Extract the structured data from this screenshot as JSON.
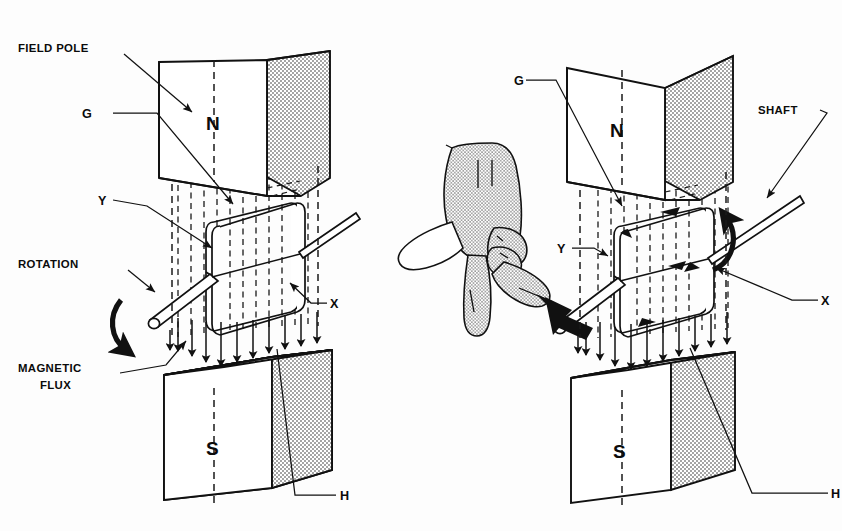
{
  "figure": {
    "kind": "technical-line-drawing",
    "background_color": "#fdfdfd",
    "ink_color": "#111111",
    "stipple_color": "#9a9a9a"
  },
  "panels": [
    {
      "id": "left",
      "name": "left-diagram",
      "labels": {
        "field_pole": "FIELD POLE",
        "g": "G",
        "y": "Y",
        "x": "X",
        "h": "H",
        "north_pole": "N",
        "south_pole": "S",
        "rotation": "ROTATION",
        "magnetic_flux": "MAGNETIC\nFLUX",
        "magnetic_flux_line1": "MAGNETIC",
        "magnetic_flux_line2": "FLUX"
      }
    },
    {
      "id": "right",
      "name": "right-diagram",
      "labels": {
        "g": "G",
        "y": "Y",
        "x": "X",
        "h": "H",
        "shaft": "SHAFT",
        "north_pole": "N",
        "south_pole": "S"
      }
    }
  ],
  "icons": {
    "rotation_arrow": "curved-rotation-arrow",
    "flux_arrow": "down-flux-arrow",
    "hand": "right-hand-rule-hand",
    "shaft": "shaft-rod",
    "coil": "armature-loop"
  }
}
